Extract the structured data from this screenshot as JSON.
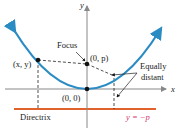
{
  "diagram": {
    "type": "parabola-focus-directrix",
    "axes": {
      "x_label": "x",
      "y_label": "y"
    },
    "labels": {
      "focus": "Focus",
      "focus_point": "(0, p)",
      "vertex": "(0, 0)",
      "point": "(x, y)",
      "equally": "Equally",
      "distant": "distant",
      "directrix": "Directrix",
      "directrix_equation": "y = −p"
    },
    "colors": {
      "parabola": "#2b8cc4",
      "directrix": "#e2622d",
      "axes": "#888888",
      "equation_text": "#d6336c",
      "points": "#111111"
    }
  }
}
